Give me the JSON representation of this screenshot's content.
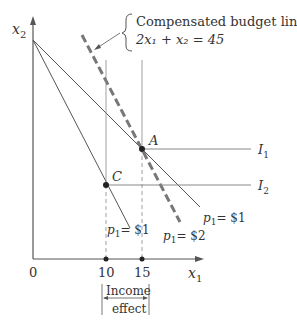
{
  "axes": {
    "y_label": "x",
    "y_label_sub": "2",
    "x_label": "x",
    "x_label_sub": "1",
    "origin": "0",
    "ticks": [
      "10",
      "15"
    ]
  },
  "annotation": {
    "title": "Compensated budget line",
    "equation": "2x₁ + x₂ = 45"
  },
  "points": {
    "A": "A",
    "C": "C"
  },
  "indifference_curves": [
    "I",
    "I"
  ],
  "ic_subs": [
    "1",
    "2"
  ],
  "price_labels": {
    "steep_line": "= $1",
    "compensated": "= $2",
    "original": "= $1",
    "p": "p",
    "sub": "1"
  },
  "income_effect": {
    "line1": "Income",
    "line2": "effect"
  },
  "colors": {
    "line": "#555555",
    "dashed": "#777777",
    "text": "#333333"
  }
}
